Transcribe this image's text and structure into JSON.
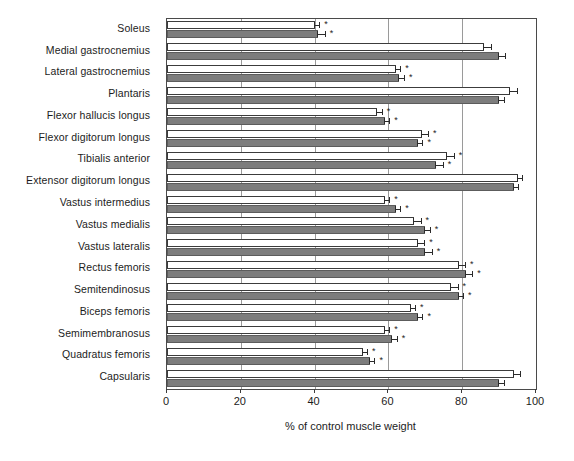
{
  "chart_data": {
    "type": "bar",
    "orientation": "horizontal",
    "title": "",
    "xlabel": "% of control muscle weight",
    "ylabel": "",
    "xlim": [
      0,
      100
    ],
    "xticks": [
      0,
      20,
      40,
      60,
      80,
      100
    ],
    "xtick_labels": [
      "0",
      "20",
      "40",
      "60",
      "80",
      "100"
    ],
    "grid": true,
    "grid_axis": "x",
    "legend": null,
    "categories": [
      "Soleus",
      "Medial gastrocnemius",
      "Lateral gastrocnemius",
      "Plantaris",
      "Flexor hallucis longus",
      "Flexor digitorum longus",
      "Tibialis anterior",
      "Extensor digitorum longus",
      "Vastus intermedius",
      "Vastus medialis",
      "Vastus lateralis",
      "Rectus femoris",
      "Semitendinosus",
      "Biceps femoris",
      "Semimembranosus",
      "Quadratus femoris",
      "Capsularis"
    ],
    "series": [
      {
        "name": "series-1",
        "style": "open",
        "color": "#ffffff",
        "values": [
          40,
          86,
          62,
          93,
          57,
          69,
          76,
          95,
          59,
          67,
          68,
          79,
          77,
          66,
          59,
          53,
          94
        ],
        "errors": [
          1.5,
          2.0,
          1.5,
          2.0,
          1.5,
          2.0,
          2.0,
          1.5,
          1.5,
          2.0,
          2.0,
          2.0,
          2.0,
          1.5,
          1.5,
          1.5,
          2.0
        ],
        "significance": [
          "*",
          "",
          "*",
          "",
          "*",
          "*",
          "*",
          "",
          "*",
          "*",
          "*",
          "*",
          "*",
          "*",
          "*",
          "*",
          ""
        ]
      },
      {
        "name": "series-2",
        "style": "filled",
        "color": "#7d7d7d",
        "values": [
          41,
          90,
          63,
          90,
          59,
          68,
          73,
          94,
          62,
          70,
          70,
          81,
          79,
          68,
          61,
          55,
          90
        ],
        "errors": [
          2.0,
          2.0,
          1.5,
          1.5,
          1.5,
          1.5,
          2.0,
          1.5,
          1.5,
          1.5,
          2.0,
          2.0,
          1.5,
          1.5,
          1.5,
          1.5,
          1.5
        ],
        "significance": [
          "*",
          "",
          "*",
          "",
          "*",
          "*",
          "*",
          "",
          "*",
          "*",
          "*",
          "*",
          "*",
          "*",
          "*",
          "*",
          ""
        ]
      }
    ]
  }
}
